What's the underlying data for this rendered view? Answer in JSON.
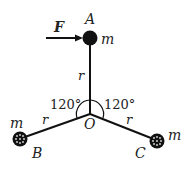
{
  "diagram": {
    "labels": {
      "force": "F",
      "point_a": "A",
      "point_b": "B",
      "point_c": "C",
      "center": "O",
      "mass_a": "m",
      "mass_b": "m",
      "mass_c": "m",
      "rod_oa": "r",
      "rod_ob": "r",
      "rod_oc": "r",
      "angle_left": "120°",
      "angle_right": "120°"
    },
    "colors": {
      "ink": "#111111",
      "background": "#ffffff"
    }
  }
}
